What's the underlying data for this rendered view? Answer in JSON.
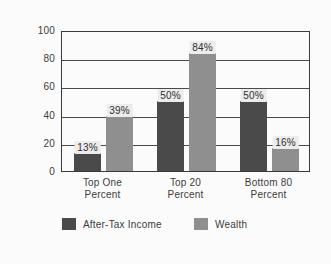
{
  "chart_data": {
    "type": "bar",
    "title": "",
    "xlabel": "",
    "ylabel": "Percent",
    "ylim": [
      0,
      100
    ],
    "ytick_labels": [
      "100",
      "80",
      "60",
      "40",
      "20",
      "0"
    ],
    "yticks": [
      100,
      80,
      60,
      40,
      20,
      0
    ],
    "grid": true,
    "legend_position": "bottom",
    "categories": [
      "Top One Percent",
      "Top 20 Percent",
      "Bottom 80 Percent"
    ],
    "category_lines": [
      [
        "Top One",
        "Percent"
      ],
      [
        "Top 20",
        "Percent"
      ],
      [
        "Bottom 80",
        "Percent"
      ]
    ],
    "series": [
      {
        "name": "After-Tax Income",
        "color": "#4a4a4a",
        "values": [
          13,
          50,
          50
        ],
        "labels": [
          "13%",
          "50%",
          "50%"
        ]
      },
      {
        "name": "Wealth",
        "color": "#8f8f8f",
        "values": [
          39,
          84,
          16
        ],
        "labels": [
          "39%",
          "84%",
          "16%"
        ]
      }
    ]
  },
  "legend": {
    "entries": [
      {
        "label": "After-Tax Income",
        "swatch": "income"
      },
      {
        "label": "Wealth",
        "swatch": "wealth"
      }
    ]
  }
}
